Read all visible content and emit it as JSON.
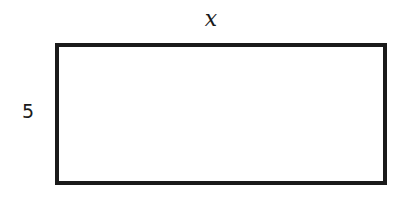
{
  "diagram": {
    "shape": "rectangle",
    "width_label": "x",
    "height_label": "5",
    "stroke_color": "#1a1a1a"
  }
}
